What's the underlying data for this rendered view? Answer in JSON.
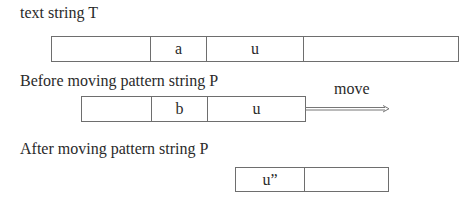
{
  "labels": {
    "text_string": "text string T",
    "before": "Before moving pattern string P",
    "after": "After moving pattern string P",
    "move": "move"
  },
  "text_string_cells": [
    "",
    "a",
    "u",
    ""
  ],
  "pattern_before_cells": [
    "",
    "b",
    "u"
  ],
  "pattern_after_cells": [
    "u”",
    ""
  ]
}
